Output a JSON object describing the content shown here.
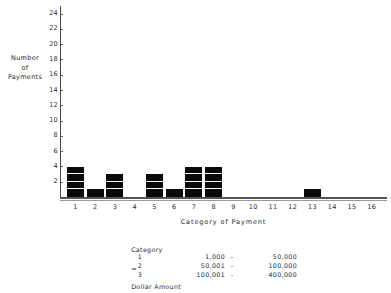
{
  "chart_data": {
    "type": "bar",
    "title": "",
    "subtitle": "",
    "xlabel": "Category of Payment",
    "ylabel": "Number of Payments",
    "ylabel_lines": [
      "Number",
      "of",
      "Payments"
    ],
    "categories": [
      "1",
      "2",
      "3",
      "4",
      "5",
      "6",
      "7",
      "8",
      "9",
      "10",
      "11",
      "12",
      "13",
      "14",
      "15",
      "16"
    ],
    "values": [
      4,
      1,
      3,
      0,
      3,
      1,
      4,
      4,
      0,
      0,
      0,
      0,
      1,
      0,
      0,
      0
    ],
    "ytick_labels": [
      "2",
      "4",
      "6",
      "8",
      "10",
      "12",
      "14",
      "16",
      "18",
      "20",
      "22",
      "24"
    ],
    "ytick_values": [
      2,
      4,
      6,
      8,
      10,
      12,
      14,
      16,
      18,
      20,
      22,
      24
    ],
    "ylim": [
      0,
      25
    ],
    "xlim": [
      0.5,
      16.5
    ],
    "grid": false,
    "legend": "none",
    "bar_color": "#0a0a0a",
    "axis_color": "#555555",
    "segmented_bars": true,
    "segment_unit": 1
  },
  "legend_table": {
    "header": {
      "category": "Category",
      "equals": "=",
      "amount": "Dollar Amount"
    },
    "rows": [
      {
        "category": "1",
        "low": "1,000",
        "dash": "-",
        "high": "50,000"
      },
      {
        "category": "2",
        "low": "50,001",
        "dash": "-",
        "high": "100,000"
      },
      {
        "category": "3",
        "low": "100,001",
        "dash": "-",
        "high": "400,000"
      }
    ]
  }
}
